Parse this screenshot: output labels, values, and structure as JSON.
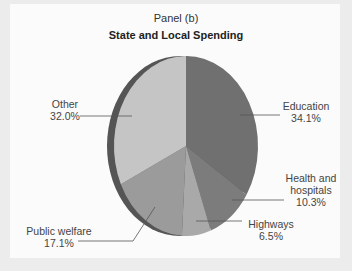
{
  "chart_data": {
    "type": "pie",
    "panel_label": "Panel (b)",
    "title": "State and Local Spending",
    "categories": [
      "Education",
      "Health and hospitals",
      "Highways",
      "Public welfare",
      "Other"
    ],
    "values": [
      34.1,
      10.3,
      6.5,
      17.1,
      32.0
    ],
    "unit": "%",
    "colors": [
      "#707070",
      "#7c7c7c",
      "#a9a9a9",
      "#9b9b9b",
      "#c5c5c5"
    ],
    "edge_color": "#555555",
    "labels": [
      {
        "name": "Education",
        "value": "34.1%"
      },
      {
        "name_line1": "Health and",
        "name_line2": "hospitals",
        "value": "10.3%"
      },
      {
        "name": "Highways",
        "value": "6.5%"
      },
      {
        "name": "Public welfare",
        "value": "17.1%"
      },
      {
        "name": "Other",
        "value": "32.0%"
      }
    ],
    "legend": "none (direct labels with leader lines)",
    "style": "3D tilted pie"
  }
}
